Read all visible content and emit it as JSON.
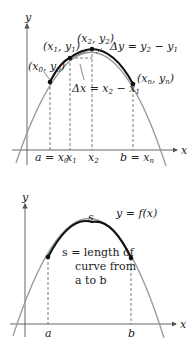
{
  "top_figure": {
    "axis_labels": {
      "x": "x",
      "y": "y"
    },
    "points": [
      {
        "label_main": "(x",
        "sub1": "0",
        "mid": ", y",
        "sub2": "0",
        "end": ")"
      },
      {
        "label_main": "(x",
        "sub1": "1",
        "mid": ", y",
        "sub2": "1",
        "end": ")"
      },
      {
        "label_main": "(x",
        "sub1": "2",
        "mid": ", y",
        "sub2": "2",
        "end": ")"
      },
      {
        "label_main": "(x",
        "sub1": "n",
        "mid": ", y",
        "sub2": "n",
        "end": ")"
      }
    ],
    "delta_y": {
      "a": "Δy = y",
      "s1": "2",
      "b": " − y",
      "s2": "1"
    },
    "delta_x": {
      "a": "Δx = x",
      "s1": "2",
      "b": " − x",
      "s2": "1"
    },
    "ticks": [
      {
        "pre": "a = x",
        "sub": "0"
      },
      {
        "pre": "x",
        "sub": "1"
      },
      {
        "pre": "x",
        "sub": "2"
      },
      {
        "pre": "b = x",
        "sub": "n"
      }
    ]
  },
  "bottom_figure": {
    "axis_labels": {
      "x": "x",
      "y": "y"
    },
    "function_label": "y = f(x)",
    "arc_label": "s",
    "description": [
      "s = length of",
      "curve from",
      "a to b"
    ],
    "ticks": [
      "a",
      "b"
    ]
  }
}
